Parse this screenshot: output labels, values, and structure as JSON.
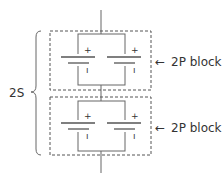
{
  "diagram": {
    "title": "",
    "series_label": "2S",
    "blocks": [
      {
        "label": "2P block",
        "arrow_icon": "left-arrow",
        "cells": [
          {
            "positive_mark": "+",
            "negative_mark": "ı"
          },
          {
            "positive_mark": "+",
            "negative_mark": "ı"
          }
        ]
      },
      {
        "label": "2P block",
        "arrow_icon": "left-arrow",
        "cells": [
          {
            "positive_mark": "+",
            "negative_mark": "ı"
          },
          {
            "positive_mark": "+",
            "negative_mark": "ı"
          }
        ]
      }
    ],
    "arrow_glyph": "←",
    "colors": {
      "line": "#666666",
      "text": "#333333",
      "background": "#ffffff"
    }
  }
}
